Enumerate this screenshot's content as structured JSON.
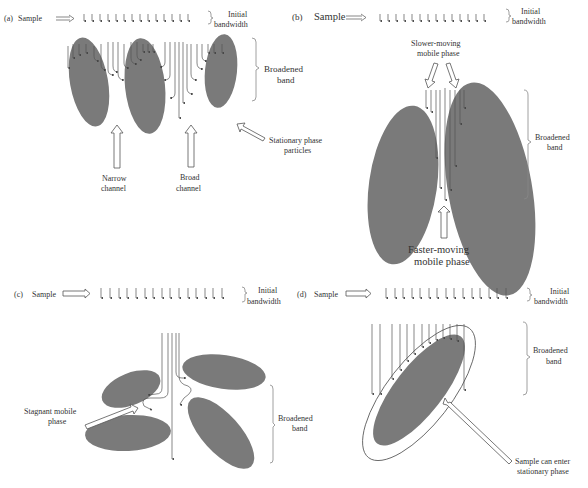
{
  "panels": {
    "a": {
      "id": "(a)",
      "sample_label": "Sample",
      "initial_label_1": "Initial",
      "initial_label_2": "bandwidth",
      "broadened_label_1": "Broadened",
      "broadened_label_2": "band",
      "narrow_label_1": "Narrow",
      "narrow_label_2": "channel",
      "broad_label_1": "Broad",
      "broad_label_2": "channel",
      "stationary_label_1": "Stationary phase",
      "stationary_label_2": "particles",
      "sample_arrow_count": 17
    },
    "b": {
      "id": "(b)",
      "sample_label": "Sample",
      "initial_label_1": "Initial",
      "initial_label_2": "bandwidth",
      "slower_label_1": "Slower-moving",
      "slower_label_2": "mobile phase",
      "broadened_label_1": "Broadened",
      "broadened_label_2": "band",
      "faster_label_1": "Faster-moving",
      "faster_label_2": "mobile phase",
      "sample_arrow_count": 17
    },
    "c": {
      "id": "(c)",
      "sample_label": "Sample",
      "initial_label_1": "Initial",
      "initial_label_2": "bandwidth",
      "stagnant_label_1": "Stagnant mobile",
      "stagnant_label_2": "phase",
      "broadened_label_1": "Broadened",
      "broadened_label_2": "band",
      "sample_arrow_count": 17
    },
    "d": {
      "id": "(d)",
      "sample_label": "Sample",
      "initial_label_1": "Initial",
      "initial_label_2": "bandwidth",
      "broadened_label_1": "Broadened",
      "broadened_label_2": "band",
      "enter_label_1": "Sample can enter",
      "enter_label_2": "stationary phase",
      "sample_arrow_count": 17
    }
  },
  "colors": {
    "particle": "#7a7a7a",
    "line": "#555555",
    "text": "#333333"
  }
}
